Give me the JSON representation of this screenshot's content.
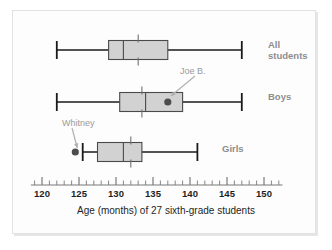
{
  "caption": "Age (months) of 27 sixth-grade students",
  "axis": {
    "min": 118.5,
    "max": 152.5,
    "tick_labels": [
      "120",
      "125",
      "130",
      "135",
      "140",
      "145",
      "150"
    ],
    "tick_values": [
      120,
      125,
      130,
      135,
      140,
      145,
      150
    ],
    "minor_step": 1,
    "label_color": "#1f1f1f",
    "line_color": "#7a7a7a"
  },
  "colors": {
    "box_fill": "#d2d2d2",
    "box_stroke": "#4a4a4a",
    "whisker": "#1a1a1a",
    "label": "#8d8d8d",
    "annotation": "#9a9a9a",
    "point": "#4d4d4d",
    "background": "#fdfdfd"
  },
  "series_labels": [
    {
      "name": "all-students",
      "label": "All\nstudents"
    },
    {
      "name": "boys",
      "label": "Boys"
    },
    {
      "name": "girls",
      "label": "Girls"
    }
  ],
  "annotations": [
    {
      "name": "joe-b",
      "label": "Joe B.",
      "points_to": 137.0,
      "series": "boys"
    },
    {
      "name": "whitney",
      "label": "Whitney",
      "points_to": 124.5,
      "series": "girls"
    }
  ],
  "chart_data": {
    "type": "box",
    "title": "",
    "xlabel": "Age (months) of 27 sixth-grade students",
    "ylabel": "",
    "xlim": [
      118.5,
      152.5
    ],
    "grid": false,
    "legend": "none",
    "orientation": "horizontal",
    "n": 27,
    "series": [
      {
        "name": "All students",
        "min": 122.0,
        "q1": 129.0,
        "median": 131.0,
        "mean": 133.0,
        "q3": 137.0,
        "max": 147.0,
        "outliers": []
      },
      {
        "name": "Boys",
        "min": 122.0,
        "q1": 130.5,
        "median": 134.0,
        "mean": 133.5,
        "q3": 139.0,
        "max": 147.0,
        "outliers": [],
        "marked_points": [
          {
            "label": "Joe B.",
            "value": 137.0
          }
        ]
      },
      {
        "name": "Girls",
        "min": 125.5,
        "q1": 127.5,
        "median": 131.0,
        "mean": 132.0,
        "q3": 133.5,
        "max": 141.0,
        "outliers": [
          124.5
        ],
        "marked_points": [
          {
            "label": "Whitney",
            "value": 124.5
          }
        ]
      }
    ]
  }
}
